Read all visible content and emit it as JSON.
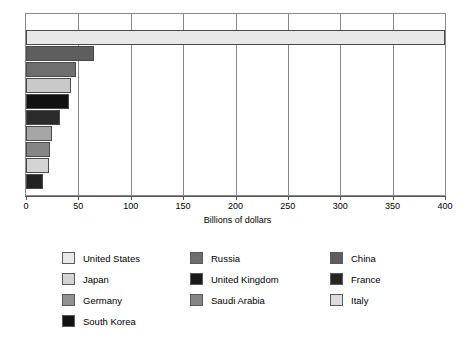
{
  "chart_data": {
    "type": "bar",
    "orientation": "horizontal",
    "title": "",
    "subtitle": "",
    "xlabel": "Billions of dollars",
    "ylabel": "",
    "xlim": [
      0,
      400
    ],
    "xticks": [
      0,
      50,
      100,
      150,
      200,
      250,
      300,
      350,
      400
    ],
    "xtick_labels": [
      "0",
      "50",
      "100",
      "150",
      "200",
      "250",
      "300",
      "350",
      "400"
    ],
    "grid": true,
    "grid_axis": "x",
    "legend_position": "bottom",
    "legend_columns": 3,
    "categories": [
      "United States",
      "China",
      "Russia",
      "Germany",
      "South Korea",
      "United Kingdom",
      "France",
      "Saudi Arabia",
      "Japan",
      "Italy"
    ],
    "values": [
      400,
      65,
      48,
      43,
      41,
      32,
      25,
      23,
      22,
      16
    ],
    "bar_colors": [
      "#e8e8e8",
      "#5e5e5e",
      "#6e6e6e",
      "#c9c9c9",
      "#111111",
      "#2b2b2b",
      "#a6a6a6",
      "#858585",
      "#d4d4d4",
      "#222222"
    ]
  },
  "axis": {
    "x_title": "Billions of dollars",
    "tick_labels": [
      "0",
      "50",
      "100",
      "150",
      "200",
      "250",
      "300",
      "350",
      "400"
    ]
  },
  "legend": {
    "columns": [
      {
        "items": [
          {
            "label": "United States",
            "color": "#e8e8e8"
          },
          {
            "label": "Japan",
            "color": "#d4d4d4"
          },
          {
            "label": "Germany",
            "color": "#919191"
          },
          {
            "label": "South Korea",
            "color": "#111111"
          }
        ]
      },
      {
        "items": [
          {
            "label": "Russia",
            "color": "#6e6e6e"
          },
          {
            "label": "United Kingdom",
            "color": "#1a1a1a"
          },
          {
            "label": "Saudi Arabia",
            "color": "#858585"
          }
        ]
      },
      {
        "items": [
          {
            "label": "China",
            "color": "#5e5e5e"
          },
          {
            "label": "France",
            "color": "#262626"
          },
          {
            "label": "Italy",
            "color": "#dcdcdc"
          }
        ]
      }
    ]
  }
}
